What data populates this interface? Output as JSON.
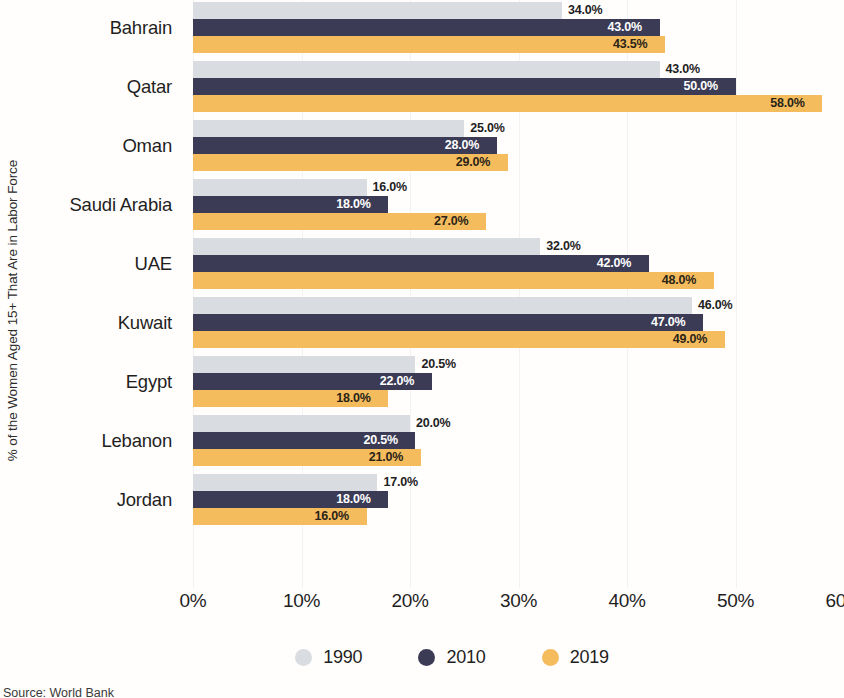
{
  "chart_data": {
    "type": "bar",
    "orientation": "horizontal",
    "title": "",
    "xlabel": "",
    "ylabel": "% of the Women Aged 15+ That Are in Labor Force",
    "xlim": [
      0,
      60
    ],
    "xticks": [
      "0%",
      "10%",
      "20%",
      "30%",
      "40%",
      "50%",
      "60%"
    ],
    "xtick_values": [
      0,
      10,
      20,
      30,
      40,
      50,
      60
    ],
    "grid": true,
    "legend_position": "bottom",
    "categories": [
      "Bahrain",
      "Qatar",
      "Oman",
      "Saudi Arabia",
      "UAE",
      "Kuwait",
      "Egypt",
      "Lebanon",
      "Jordan"
    ],
    "series": [
      {
        "name": "1990",
        "color": "#d9dce0",
        "values": [
          34.0,
          43.0,
          25.0,
          16.0,
          32.0,
          46.0,
          20.5,
          20.0,
          17.0
        ],
        "labels": [
          "34.0%",
          "43.0%",
          "25.0%",
          "16.0%",
          "32.0%",
          "46.0%",
          "20.5%",
          "20.0%",
          "17.0%"
        ],
        "label_placement": "outside"
      },
      {
        "name": "2010",
        "color": "#3b3b56",
        "values": [
          43.0,
          50.0,
          28.0,
          18.0,
          42.0,
          47.0,
          22.0,
          20.5,
          18.0
        ],
        "labels": [
          "43.0%",
          "50.0%",
          "28.0%",
          "18.0%",
          "42.0%",
          "47.0%",
          "22.0%",
          "20.5%",
          "18.0%"
        ],
        "label_placement": "inside-dark"
      },
      {
        "name": "2019",
        "color": "#f5bc5e",
        "values": [
          43.5,
          58.0,
          29.0,
          27.0,
          48.0,
          49.0,
          18.0,
          21.0,
          16.0
        ],
        "labels": [
          "43.5%",
          "58.0%",
          "29.0%",
          "27.0%",
          "48.0%",
          "49.0%",
          "18.0%",
          "21.0%",
          "16.0%"
        ],
        "label_placement": "inside-gold"
      }
    ],
    "legend": [
      {
        "label": "1990",
        "color": "#d9dce0"
      },
      {
        "label": "2010",
        "color": "#3b3b56"
      },
      {
        "label": "2019",
        "color": "#f5bc5e"
      }
    ]
  },
  "source": "Source: World Bank"
}
